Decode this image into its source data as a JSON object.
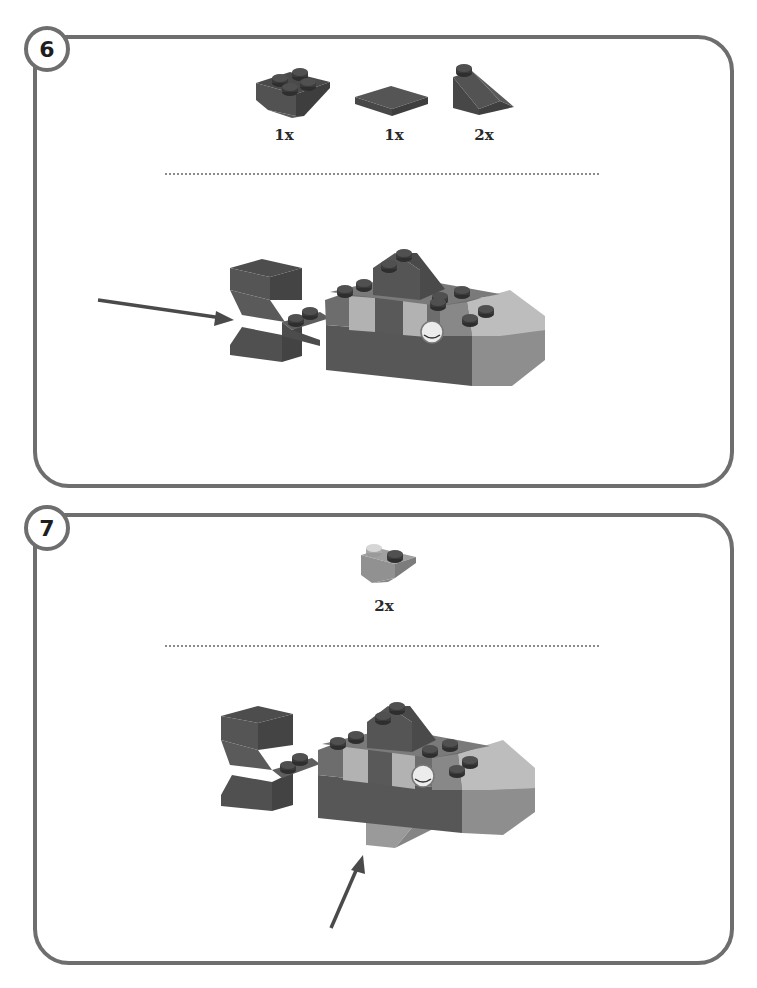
{
  "steps": [
    {
      "number": "6",
      "parts": [
        {
          "icon": "inverted-slope-brick-2x2-icon",
          "quantity": "1x"
        },
        {
          "icon": "flat-tile-2x2-icon",
          "quantity": "1x"
        },
        {
          "icon": "slope-brick-1x2-icon",
          "quantity": "2x"
        }
      ],
      "illustration": "fish-model-with-tail-added",
      "arrow": "pointer-to-tail"
    },
    {
      "number": "7",
      "parts": [
        {
          "icon": "inverted-slope-brick-1x2-light-icon",
          "quantity": "2x"
        }
      ],
      "illustration": "fish-model-with-bottom-fin-added",
      "arrow": "pointer-to-bottom-fin"
    }
  ],
  "colors": {
    "border": "#6e6e6e",
    "brick_dark": "#555555",
    "brick_mid": "#7a7a7a",
    "brick_light": "#b4b4b4",
    "arrow": "#4a4a4a"
  }
}
